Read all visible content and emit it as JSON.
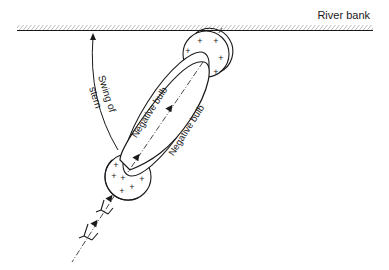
{
  "labels": {
    "river_bank": "River bank",
    "swing_line1": "Swing of",
    "swing_line2": "stern",
    "negative_bulb_left": "Negative bulb",
    "negative_bulb_right": "Negative bulb"
  },
  "symbols": {
    "positive_pressure": "+",
    "positive_marks_top": 5,
    "positive_marks_bottom": 6
  },
  "colors": {
    "stroke": "#1a1a1a",
    "background": "#ffffff"
  }
}
